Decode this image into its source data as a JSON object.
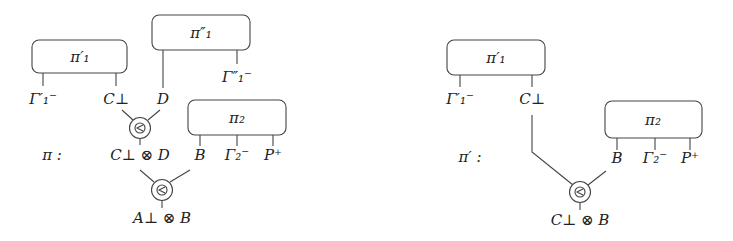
{
  "diagrams": {
    "left": {
      "name_label": "π :",
      "boxes": {
        "pi1p": "π′₁",
        "pi1pp": "π″₁",
        "pi2": "π₂"
      },
      "labels": {
        "gamma1p": "Γ′₁⁻",
        "cperp": "C⊥",
        "d": "D",
        "gamma1pp": "Γ″₁⁻",
        "cperp_tensor_d": "C⊥ ⊗ D",
        "b": "B",
        "gamma2": "Γ₂⁻",
        "pplus": "P⁺",
        "aperp_tensor_b": "A⊥ ⊗ B"
      },
      "nodes": [
        "⊗",
        "⊗"
      ]
    },
    "right": {
      "name_label": "π′ :",
      "boxes": {
        "pi1p": "π′₁",
        "pi2": "π₂"
      },
      "labels": {
        "gamma1p": "Γ′₁⁻",
        "cperp": "C⊥",
        "b": "B",
        "gamma2": "Γ₂⁻",
        "pplus": "P⁺",
        "cperp_tensor_b": "C⊥ ⊗ B"
      },
      "nodes": [
        "⊗"
      ]
    }
  }
}
